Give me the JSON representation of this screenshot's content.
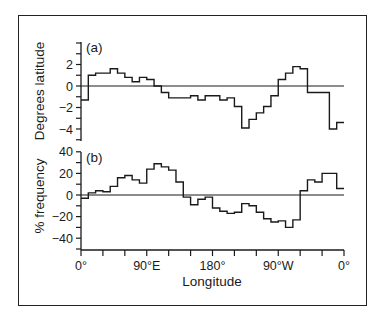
{
  "chart_data": [
    {
      "type": "line",
      "style": "step",
      "panel_label": "(a)",
      "title": "",
      "xlabel": "Longitude",
      "ylabel": "Degrees latitude",
      "ylim": [
        -5.5,
        4
      ],
      "yticks": [
        -4,
        -2,
        0,
        2
      ],
      "yticks_minor_step": 1,
      "xlim": [
        0,
        360
      ],
      "xtick_step": 30,
      "bin_edges_deg": [
        0,
        10,
        20,
        30,
        40,
        50,
        60,
        70,
        80,
        90,
        100,
        110,
        120,
        130,
        140,
        150,
        160,
        170,
        180,
        190,
        200,
        210,
        220,
        230,
        240,
        250,
        260,
        270,
        280,
        290,
        300,
        310,
        320,
        330,
        340,
        350,
        360
      ],
      "values": [
        -1.3,
        1.0,
        1.2,
        1.2,
        1.6,
        1.2,
        0.8,
        0.4,
        0.8,
        0.6,
        0.0,
        -0.6,
        -1.1,
        -1.1,
        -1.1,
        -0.9,
        -1.3,
        -0.9,
        -0.9,
        -1.3,
        -1.1,
        -1.9,
        -3.9,
        -3.1,
        -2.5,
        -1.9,
        -0.9,
        0.6,
        1.2,
        1.8,
        1.6,
        -0.6,
        -0.6,
        -0.6,
        -4.0,
        -3.4
      ],
      "reference_line": 0
    },
    {
      "type": "line",
      "style": "step",
      "panel_label": "(b)",
      "title": "",
      "xlabel": "Longitude",
      "ylabel": "% frequency",
      "ylim": [
        -50,
        40
      ],
      "yticks": [
        -40,
        -20,
        0,
        20,
        40
      ],
      "yticks_minor_step": 10,
      "xlim": [
        0,
        360
      ],
      "xtick_step": 30,
      "xtick_labels": [
        "0°",
        "90°E",
        "180°",
        "90°W",
        "0°"
      ],
      "xtick_label_positions": [
        0,
        90,
        180,
        270,
        360
      ],
      "bin_edges_deg": [
        0,
        10,
        20,
        30,
        40,
        50,
        60,
        70,
        80,
        90,
        100,
        110,
        120,
        130,
        140,
        150,
        160,
        170,
        180,
        190,
        200,
        210,
        220,
        230,
        240,
        250,
        260,
        270,
        280,
        290,
        300,
        310,
        320,
        330,
        340,
        350,
        360
      ],
      "values": [
        -3,
        2,
        4,
        3,
        8,
        16,
        18,
        14,
        11,
        24,
        29,
        26,
        23,
        12,
        -2,
        -9,
        -4,
        -2,
        -12,
        -15,
        -17,
        -16,
        -8,
        -10,
        -16,
        -22,
        -25,
        -24,
        -30,
        -23,
        4,
        14,
        12,
        20,
        20,
        6
      ],
      "reference_line": 0
    }
  ],
  "labels": {
    "panel_a_tag": "(a)",
    "panel_b_tag": "(b)",
    "panel_a_ylabel": "Degrees latitude",
    "panel_b_ylabel": "% frequency",
    "xlabel": "Longitude",
    "panel_a_yticks": [
      "2",
      "0",
      "−2",
      "−4"
    ],
    "panel_b_yticks": [
      "40",
      "20",
      "0",
      "−20",
      "−40"
    ],
    "xticks": [
      "0°",
      "90°E",
      "180°",
      "90°W",
      "0°"
    ]
  },
  "colors": {
    "line": "#1a1a1a",
    "background": "#ffffff"
  }
}
